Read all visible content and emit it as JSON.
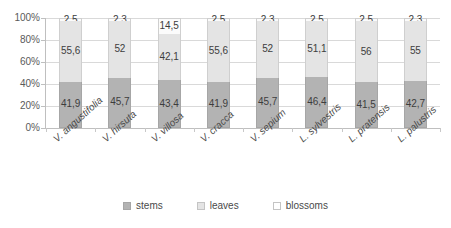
{
  "chart_data": {
    "type": "bar",
    "subtype": "stacked-100-percent",
    "title": "",
    "xlabel": "",
    "ylabel": "",
    "ylim": [
      0,
      100
    ],
    "ytick_labels": [
      "100%",
      "80%",
      "60%",
      "40%",
      "20%",
      "0%"
    ],
    "ytick_values": [
      100,
      80,
      60,
      40,
      20,
      0
    ],
    "grid": true,
    "legend_position": "bottom",
    "categories": [
      "V. angustifolia",
      "V. hirsuta",
      "V. villosa",
      "V. cracca",
      "V. sepium",
      "L. sylvestris",
      "L. pratensis",
      "L. palustris"
    ],
    "series": [
      {
        "name": "stems",
        "color": "#b3b3b3",
        "values": [
          41.9,
          45.7,
          43.4,
          41.9,
          45.7,
          46.4,
          41.5,
          42.7
        ],
        "labels": [
          "41,9",
          "45,7",
          "43,4",
          "41,9",
          "45,7",
          "46,4",
          "41,5",
          "42,7"
        ]
      },
      {
        "name": "leaves",
        "color": "#e4e4e4",
        "values": [
          55.6,
          52,
          42.1,
          55.6,
          52,
          51.1,
          56,
          55
        ],
        "labels": [
          "55,6",
          "52",
          "42,1",
          "55,6",
          "52",
          "51,1",
          "56",
          "55"
        ]
      },
      {
        "name": "blossoms",
        "color": "#fbfbfb",
        "values": [
          2.5,
          2.3,
          14.5,
          2.5,
          2.3,
          2.5,
          2.5,
          2.3
        ],
        "labels": [
          "2,5",
          "2,3",
          "14,5",
          "2,5",
          "2,3",
          "2,5",
          "2,5",
          "2,3"
        ]
      }
    ],
    "legend": [
      "stems",
      "leaves",
      "blossoms"
    ]
  }
}
